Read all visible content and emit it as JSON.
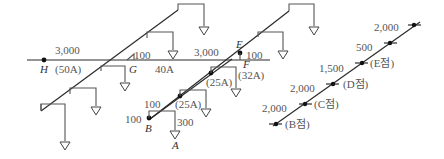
{
  "figure": {
    "colors": {
      "line": "#2b2b2b",
      "branch": "#555555",
      "text": "#555555"
    }
  },
  "main_pipe": {
    "h_to_g_length": "3,000",
    "h_to_g_size": "(50A)",
    "g_riser": "100",
    "g_to_e_length": "3,000",
    "g_to_e_size": "40A",
    "e_riser": "100",
    "f_size": "(32A)"
  },
  "branch_pipe": {
    "seg1_size": "(25A)",
    "seg2_size": "(25A)",
    "b_riser": "100",
    "b_horizontal": "100",
    "a_drop": "300"
  },
  "nodes": {
    "H": "H",
    "G": "G",
    "E": "E",
    "F": "F",
    "B": "B",
    "A": "A"
  },
  "riser_chart": {
    "segments": [
      {
        "length": "2,000",
        "point": "(B점)"
      },
      {
        "length": "2,000",
        "point": "(C점)"
      },
      {
        "length": "1,500",
        "point": "(D점)"
      },
      {
        "length": "500",
        "point": "(E점)"
      },
      {
        "length": "2,000",
        "point": ""
      }
    ]
  }
}
